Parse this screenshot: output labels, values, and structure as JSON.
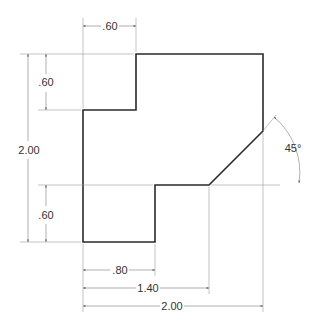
{
  "drawing": {
    "type": "orthographic-dimensioned-part",
    "colors": {
      "outline": "#2a2a2a",
      "dimension": "#7a7a7a",
      "text": "#333333",
      "background": "#ffffff"
    },
    "dimensions": {
      "top_width": ".60",
      "top_step_height": ".60",
      "overall_height": "2.00",
      "bottom_step_height": ".60",
      "bottom_width_inner": ".80",
      "chamfer_start": "1.40",
      "overall_width": "2.00",
      "chamfer_angle": "45°"
    }
  }
}
